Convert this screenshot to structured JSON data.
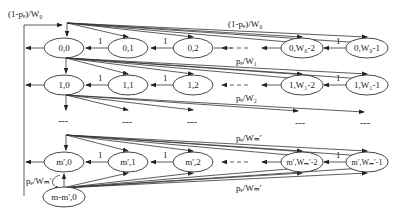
{
  "diagram": {
    "type": "markov-chain",
    "rows": [
      {
        "id": "row-0",
        "y": 48,
        "nodes": [
          {
            "label": "0,0",
            "x": 64
          },
          {
            "label": "0,1",
            "x": 128
          },
          {
            "label": "0,2",
            "x": 193
          },
          {
            "label": "0,W₀-2",
            "x": 302
          },
          {
            "label": "0,W₀-1",
            "x": 367
          }
        ],
        "fan_label": "(1-pₑ)/W₀"
      },
      {
        "id": "row-1",
        "y": 85,
        "nodes": [
          {
            "label": "1,0",
            "x": 64
          },
          {
            "label": "1,1",
            "x": 128
          },
          {
            "label": "1,2",
            "x": 193
          },
          {
            "label": "1,W₁-2",
            "x": 302
          },
          {
            "label": "1,W₁-1",
            "x": 367
          }
        ],
        "fan_label": "pₑ/W₁"
      },
      {
        "id": "row-m",
        "y": 162,
        "nodes": [
          {
            "label": "m′,0",
            "x": 64
          },
          {
            "label": "m′,1",
            "x": 128
          },
          {
            "label": "m′,2",
            "x": 193
          },
          {
            "label": "m′,Wₘ′-2",
            "x": 302
          },
          {
            "label": "m′,Wₘ′-1",
            "x": 367
          }
        ],
        "fan_label": "pₑ/Wₘ′"
      }
    ],
    "extra_node": {
      "label": "m-m′,0",
      "x": 64,
      "y": 197
    },
    "labels": {
      "top_left": "(1-pₑ)/W₀",
      "row0_fan": "(1-pₑ)/W₀",
      "row1_fan": "pₑ/W₁",
      "row2_fan": "pₑ/W₂",
      "rowm_fan_top": "pₑ/Wₘ′",
      "rowm_fan_bottom": "pₑ/Wₘ′",
      "self_loop": "pₑ/Wₘ′",
      "transition_one": "1",
      "ellipsis": "---"
    }
  }
}
